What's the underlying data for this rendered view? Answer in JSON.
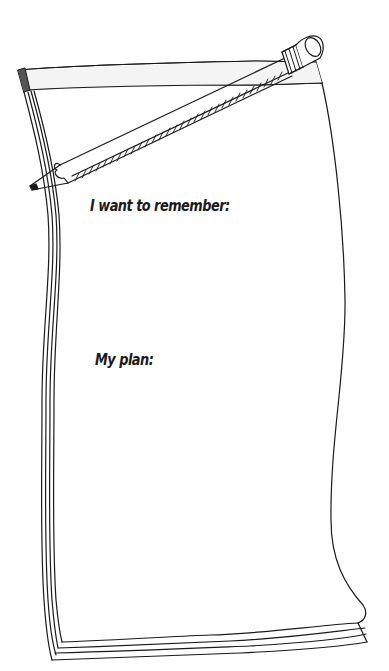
{
  "worksheet": {
    "prompts": {
      "remember_label": "I want to remember:",
      "plan_label": "My plan:"
    },
    "illustration": {
      "notepad": "notepad-drawing",
      "pencil": "pencil-drawing"
    },
    "colors": {
      "ink": "#1a1a1a",
      "paper": "#ffffff",
      "strip_shade": "#f3f3f3"
    }
  }
}
